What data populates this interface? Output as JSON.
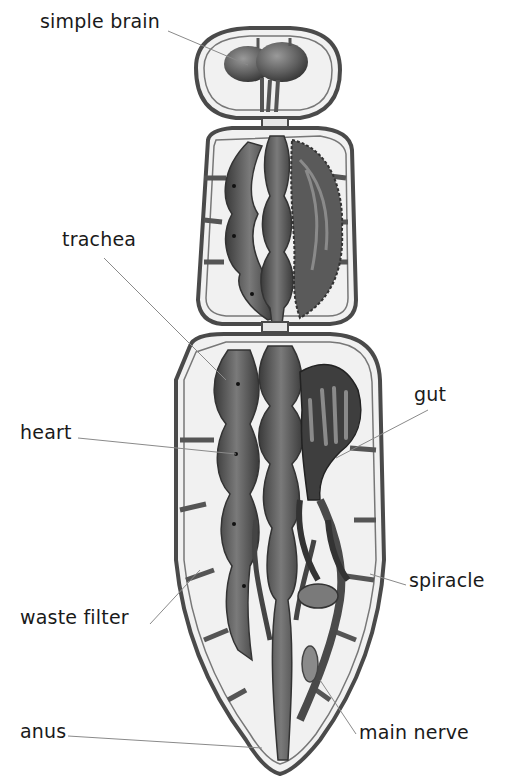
{
  "diagram": {
    "labels": [
      {
        "id": "simple-brain",
        "text": "simple brain",
        "x": 40,
        "y": 12,
        "line": [
          168,
          31,
          248,
          65
        ]
      },
      {
        "id": "trachea",
        "text": "trachea",
        "x": 62,
        "y": 230,
        "line": [
          104,
          258,
          226,
          380
        ]
      },
      {
        "id": "heart",
        "text": "heart",
        "x": 20,
        "y": 423,
        "line": [
          78,
          438,
          236,
          454
        ]
      },
      {
        "id": "gut",
        "text": "gut",
        "x": 414,
        "y": 385,
        "line": [
          428,
          410,
          336,
          458
        ]
      },
      {
        "id": "spiracle",
        "text": "spiracle",
        "x": 409,
        "y": 571,
        "line": [
          406,
          585,
          370,
          574
        ]
      },
      {
        "id": "waste-filter",
        "text": "waste filter",
        "x": 20,
        "y": 608,
        "line": [
          150,
          624,
          200,
          570
        ]
      },
      {
        "id": "anus",
        "text": "anus",
        "x": 20,
        "y": 722,
        "line": [
          68,
          736,
          262,
          748
        ]
      },
      {
        "id": "main-nerve",
        "text": "main nerve",
        "x": 359,
        "y": 723,
        "line": [
          356,
          734,
          320,
          680
        ]
      }
    ],
    "colors": {
      "background": "#ffffff",
      "text": "#1a1a1a",
      "leader_line": "#8a8a8a",
      "outline": "#4a4a4a",
      "segment_fill": "#f1f1f1",
      "organ_dark": "#3e3e3e",
      "organ_mid": "#6b6b6b",
      "organ_light": "#9a9a9a"
    }
  }
}
